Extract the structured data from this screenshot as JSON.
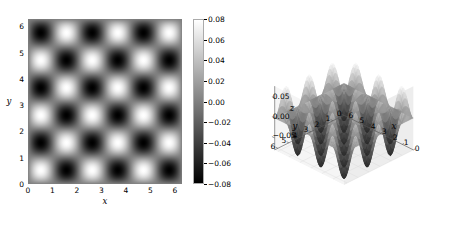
{
  "figure": {
    "background": "#ffffff",
    "colormap": "gray"
  },
  "chart_data": [
    {
      "type": "heatmap",
      "title": "",
      "xlabel": "x",
      "ylabel": "y",
      "xlim": [
        0,
        6.283185
      ],
      "ylim": [
        0,
        6.283185
      ],
      "zlim": [
        -0.08,
        0.08
      ],
      "xticks": [
        0,
        1,
        2,
        3,
        4,
        5,
        6
      ],
      "yticks": [
        0,
        1,
        2,
        3,
        4,
        5,
        6
      ],
      "xticklabels": [
        "0",
        "1",
        "2",
        "3",
        "4",
        "5",
        "6"
      ],
      "yticklabels": [
        "0",
        "1",
        "2",
        "3",
        "4",
        "5",
        "6"
      ],
      "grid": false,
      "function": "0.08*sin(3x)*sin(3y)",
      "amplitude": 0.08,
      "wavenumber": 3,
      "colorbar": {
        "orientation": "vertical",
        "vmin": -0.08,
        "vmax": 0.08,
        "ticks": [
          0.08,
          0.06,
          0.04,
          0.02,
          0.0,
          -0.02,
          -0.04,
          -0.06,
          -0.08
        ],
        "ticklabels": [
          "0.08",
          "0.06",
          "0.04",
          "0.02",
          "0.00",
          "−0.02",
          "−0.04",
          "−0.06",
          "−0.08"
        ],
        "cmap_top_color": "#ffffff",
        "cmap_bottom_color": "#000000"
      }
    },
    {
      "type": "surface",
      "title": "",
      "xlabel": "x",
      "ylabel": "y",
      "zlabel": "z",
      "xlim": [
        0,
        6.283185
      ],
      "ylim": [
        0,
        6.283185
      ],
      "zlim": [
        -0.08,
        0.08
      ],
      "xticks": [
        0,
        1,
        2,
        3,
        4,
        5,
        6
      ],
      "yticks": [
        0,
        1,
        2,
        3,
        4,
        5,
        6
      ],
      "zticks": [
        0.05,
        0.0,
        -0.05
      ],
      "xticklabels": [
        "6",
        "5",
        "4",
        "3",
        "2",
        "1",
        "0"
      ],
      "yticklabels": [
        "0",
        "1",
        "2",
        "3",
        "4",
        "5",
        "6"
      ],
      "zticklabels": [
        "0.05",
        "0.00",
        "−0.05"
      ],
      "function": "0.08*sin(3x)*sin(3y)",
      "amplitude": 0.08,
      "wavenumber": 3,
      "elev": 30,
      "azim": -135,
      "grid": true,
      "pane_color": "#f2f2f2",
      "cmap_top_color": "#ffffff",
      "cmap_bottom_color": "#303030"
    }
  ]
}
